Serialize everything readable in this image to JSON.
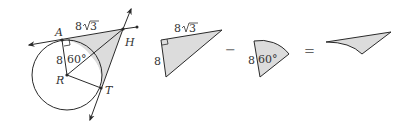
{
  "colors": {
    "stroke": "#2a2a2a",
    "shade": "#dcdcdc",
    "background": "#ffffff"
  },
  "figure1": {
    "points": {
      "A": "A",
      "H": "H",
      "R": "R",
      "T": "T"
    },
    "tangent_length_label": "8",
    "sqrt_label": "3",
    "radius_label": "8",
    "angle_label": "60°"
  },
  "figure2": {
    "description": "right triangle",
    "leg_long_coef": "8",
    "leg_long_sqrt": "3",
    "leg_short_label": "8"
  },
  "operator_minus": "−",
  "figure3": {
    "description": "60 degree sector",
    "radius_label": "8",
    "angle_label": "60°"
  },
  "operator_equals": "=",
  "figure4": {
    "description": "shaded region result"
  }
}
